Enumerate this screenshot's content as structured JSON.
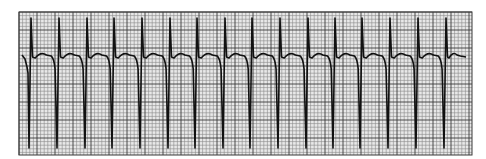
{
  "figure": {
    "kind": "ecg-rhythm-strip",
    "background": "#ffffff",
    "grid": {
      "x": 19,
      "y": 12,
      "width": 453,
      "height": 143,
      "minor_step": 3.6,
      "major_every": 5,
      "minor_color": "#8a8a8a",
      "major_color": "#3a3a3a",
      "fill": "#e8e8e8"
    },
    "trace": {
      "color": "#111111",
      "baseline_y": 57,
      "peak_y": 18,
      "trough_y": 148,
      "beat_x": [
        31,
        59,
        87,
        114,
        142,
        170,
        197,
        225,
        252,
        280,
        308,
        335,
        362,
        390,
        418,
        446
      ],
      "end_x": 466
    }
  }
}
